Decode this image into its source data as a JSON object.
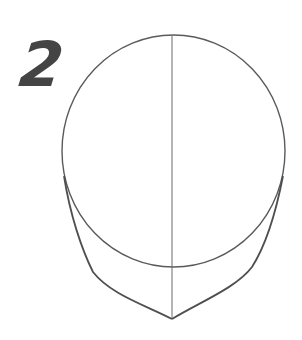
{
  "step": {
    "number": "2"
  },
  "colors": {
    "background": "#ffffff",
    "stroke": "#5a5a5a",
    "step_number": "#444444"
  },
  "drawing": {
    "description": "Head construction: cranium circle with vertical center line and jaw/chin outline",
    "elements": [
      "cranium-circle",
      "center-guideline",
      "jaw-outline"
    ]
  }
}
